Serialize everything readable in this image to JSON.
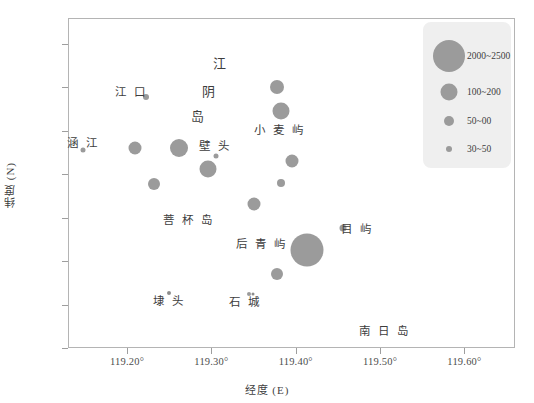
{
  "chart_data": {
    "type": "scatter",
    "title": "",
    "xlabel": "经度 (E)",
    "ylabel": "纬度 (N)",
    "xlim": [
      119.13,
      119.66
    ],
    "ylim": [
      25.2,
      25.58
    ],
    "grid": false,
    "xticks": [
      "119.20°",
      "119.30°",
      "119.40°",
      "119.50°",
      "119.60°"
    ],
    "xtick_values": [
      119.2,
      119.3,
      119.4,
      119.5,
      119.6
    ],
    "yticks": [
      "25.20°",
      "25.25°",
      "25.30°",
      "25.35°",
      "25.40°",
      "25.45°",
      "25.50°",
      "25.55°"
    ],
    "ytick_values": [
      25.2,
      25.25,
      25.3,
      25.35,
      25.4,
      25.45,
      25.5,
      25.55
    ],
    "size_encoding": "bubble area encodes production class",
    "bubble_color": "#9b9b9b",
    "points": [
      {
        "name": "涵江站点",
        "x": 119.148,
        "y": 25.428,
        "size": 5,
        "class": "30~50"
      },
      {
        "name": "江口站点",
        "x": 119.222,
        "y": 25.489,
        "size": 6,
        "class": "30~50"
      },
      {
        "name": "点1",
        "x": 119.209,
        "y": 25.43,
        "size": 13,
        "class": "100~200"
      },
      {
        "name": "点2",
        "x": 119.262,
        "y": 25.43,
        "size": 18,
        "class": "100~200"
      },
      {
        "name": "点3",
        "x": 119.232,
        "y": 25.389,
        "size": 12,
        "class": "100~200"
      },
      {
        "name": "点4",
        "x": 119.296,
        "y": 25.406,
        "size": 17,
        "class": "100~200"
      },
      {
        "name": "壁头站点",
        "x": 119.306,
        "y": 25.421,
        "size": 5,
        "class": "30~50"
      },
      {
        "name": "点5",
        "x": 119.378,
        "y": 25.501,
        "size": 14,
        "class": "100~200"
      },
      {
        "name": "点6",
        "x": 119.383,
        "y": 25.473,
        "size": 17,
        "class": "100~200"
      },
      {
        "name": "点7",
        "x": 119.396,
        "y": 25.415,
        "size": 13,
        "class": "100~200"
      },
      {
        "name": "点8",
        "x": 119.383,
        "y": 25.39,
        "size": 8,
        "class": "50~00"
      },
      {
        "name": "点9",
        "x": 119.35,
        "y": 25.366,
        "size": 13,
        "class": "100~200"
      },
      {
        "name": "点10",
        "x": 119.413,
        "y": 25.313,
        "size": 33,
        "class": "2000~2500"
      },
      {
        "name": "点11",
        "x": 119.378,
        "y": 25.285,
        "size": 12,
        "class": "100~200"
      },
      {
        "name": "目屿站点",
        "x": 119.456,
        "y": 25.338,
        "size": 7,
        "class": "50~00"
      },
      {
        "name": "埭头站点",
        "x": 119.25,
        "y": 25.263,
        "size": 4,
        "class": "30~50"
      },
      {
        "name": "石城站点",
        "x": 119.345,
        "y": 25.262,
        "size": 4,
        "class": "30~50"
      }
    ],
    "annotations": [
      {
        "text": "江 口",
        "x": 119.205,
        "y": 25.496,
        "style": "normal"
      },
      {
        "text": "涵 江",
        "x": 119.148,
        "y": 25.437,
        "style": "normal"
      },
      {
        "text": "江",
        "x": 119.312,
        "y": 25.529,
        "style": "big"
      },
      {
        "text": "阴",
        "x": 119.298,
        "y": 25.497,
        "style": "big"
      },
      {
        "text": "岛",
        "x": 119.285,
        "y": 25.468,
        "style": "big"
      },
      {
        "text": "壁 头",
        "x": 119.305,
        "y": 25.434,
        "style": "normal"
      },
      {
        "text": "小 麦 屿",
        "x": 119.381,
        "y": 25.452,
        "style": "normal"
      },
      {
        "text": "菩 杯 岛",
        "x": 119.273,
        "y": 25.349,
        "style": "normal"
      },
      {
        "text": "后 青 屿",
        "x": 119.36,
        "y": 25.321,
        "style": "normal"
      },
      {
        "text": "目 屿",
        "x": 119.473,
        "y": 25.338,
        "style": "normal"
      },
      {
        "text": "埭 头",
        "x": 119.25,
        "y": 25.255,
        "style": "normal"
      },
      {
        "text": "石 城",
        "x": 119.34,
        "y": 25.254,
        "style": "normal"
      },
      {
        "text": "南 日 岛",
        "x": 119.506,
        "y": 25.221,
        "style": "normal"
      }
    ],
    "site_dots": [
      {
        "x": 119.25,
        "y": 25.263
      },
      {
        "x": 119.349,
        "y": 25.262
      }
    ],
    "legend": {
      "position": "top-right",
      "background": "#efefef",
      "entries": [
        {
          "label": "2000~2500",
          "size": 32
        },
        {
          "label": "100~200",
          "size": 17
        },
        {
          "label": "50~00",
          "size": 10
        },
        {
          "label": "30~50",
          "size": 6
        }
      ]
    }
  }
}
